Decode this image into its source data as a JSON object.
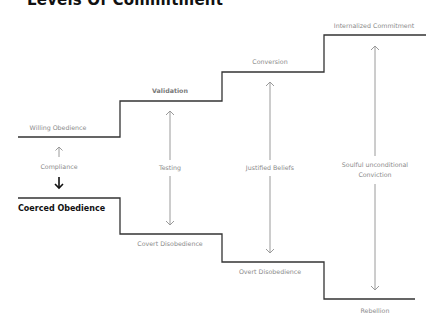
{
  "title": "Levels Of Commitment",
  "levels": {
    "upper": [
      {
        "label": "Willing Obedience"
      },
      {
        "label": "Validation"
      },
      {
        "label": "Conversion"
      },
      {
        "label": "Internalized Commitment"
      }
    ],
    "lower": [
      {
        "label": "Coerced Obedience"
      },
      {
        "label": "Covert Disobedience"
      },
      {
        "label": "Overt Disobedience"
      },
      {
        "label": "Rebellion"
      }
    ]
  },
  "spans": [
    {
      "label": "Compliance"
    },
    {
      "label": "Testing"
    },
    {
      "label": "Justified Beliefs"
    },
    {
      "label": "Soulful unconditional Conviction"
    }
  ],
  "colors": {
    "line": "#333333",
    "arrow": "#9a9a9a",
    "label": "#8a8a8a",
    "emphasis": "#111111"
  }
}
